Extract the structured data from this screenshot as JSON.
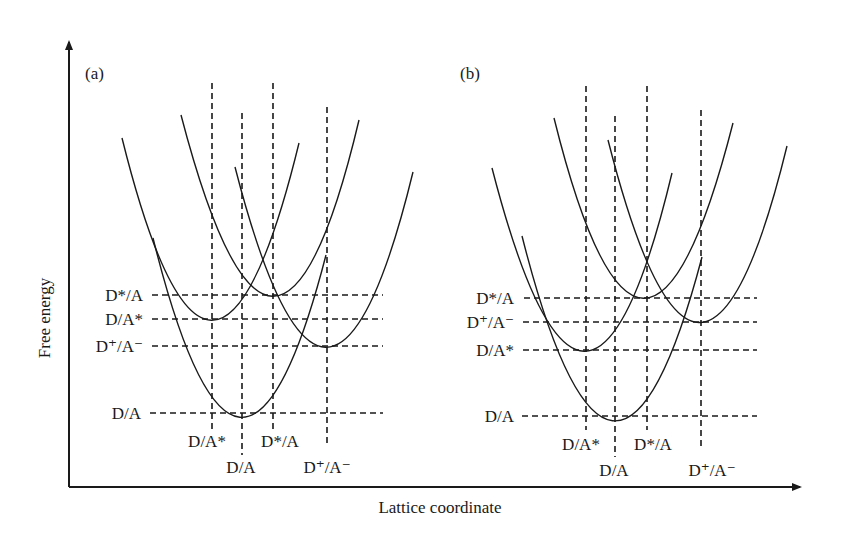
{
  "axes": {
    "y_label": "Free energy",
    "x_label": "Lattice coordinate"
  },
  "panels": [
    {
      "id": "a",
      "label": "(a)",
      "energy_levels_top_to_bottom": [
        "D*/A",
        "D/A*",
        "D⁺/A⁻",
        "D/A"
      ],
      "coordinate_labels": {
        "D_A_star": "D/A*",
        "D_A": "D/A",
        "D_star_A": "D*/A",
        "D_plus_A_minus": "D⁺/A⁻"
      },
      "level_labels": {
        "D_star_A": "D*/A",
        "D_A_star": "D/A*",
        "D_plus_A_minus": "D⁺/A⁻",
        "D_A": "D/A"
      }
    },
    {
      "id": "b",
      "label": "(b)",
      "energy_levels_top_to_bottom": [
        "D*/A",
        "D⁺/A⁻",
        "D/A*",
        "D/A"
      ],
      "coordinate_labels": {
        "D_A_star": "D/A*",
        "D_A": "D/A",
        "D_star_A": "D*/A",
        "D_plus_A_minus": "D⁺/A⁻"
      },
      "level_labels": {
        "D_star_A": "D*/A",
        "D_plus_A_minus": "D⁺/A⁻",
        "D_A_star": "D/A*",
        "D_A": "D/A"
      }
    }
  ],
  "colors": {
    "ink": "#1a1a1a",
    "background": "#ffffff"
  }
}
